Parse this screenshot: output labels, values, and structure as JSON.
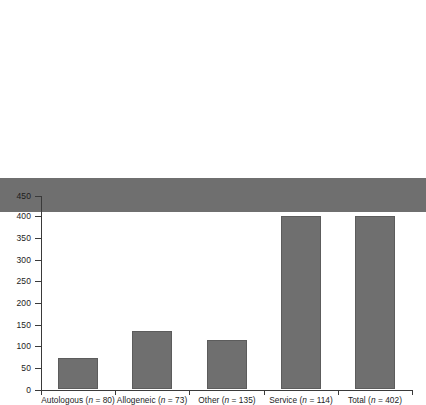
{
  "chart_data": {
    "type": "bar",
    "title": "",
    "subtitle": "",
    "xlabel": "",
    "ylabel": "",
    "categories": [
      "Autologous (n = 80)",
      "Allogeneic (n = 73)",
      "Other (n = 135)",
      "Service (n = 114)",
      "Total (n = 402)"
    ],
    "category_names": [
      "Autologous",
      "Allogeneic",
      "Other",
      "Service",
      "Total"
    ],
    "category_counts": [
      80,
      73,
      135,
      114,
      402
    ],
    "values": [
      80,
      73,
      135,
      114,
      402
    ],
    "ylim": [
      0,
      450
    ],
    "ytick_labels": [
      "0",
      "50",
      "100",
      "150",
      "200",
      "250",
      "300",
      "350",
      "400",
      "450"
    ],
    "ytick_values": [
      0,
      50,
      100,
      150,
      200,
      250,
      300,
      350,
      400,
      450
    ],
    "grid": false,
    "legend": false,
    "legend_position": "none",
    "bar_color": "#6f6f6f",
    "bar_edge_color": "#5c5c5c",
    "axis_color": "#3a3a3a",
    "background_color": "#ffffff"
  }
}
